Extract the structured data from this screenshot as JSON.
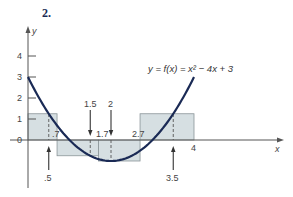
{
  "problem_label": "2.",
  "colors": {
    "curve": "#1a2a55",
    "fill": "#d6dfe2",
    "rect_stroke": "#8a9598",
    "axis": "#555555",
    "text": "#444444"
  },
  "chart_data": {
    "type": "line",
    "title": "",
    "function_label": "y = f(x) = x² − 4x + 3",
    "xlabel": "x",
    "ylabel": "y",
    "y_ticks": [
      "0",
      "1",
      "2",
      "3",
      "4"
    ],
    "x_tick_labels": [
      "4"
    ],
    "xlim": [
      0,
      6.1
    ],
    "ylim": [
      -2,
      4.8
    ],
    "curve": {
      "expression": "x^2 - 4x + 3",
      "x_range": [
        0,
        4
      ]
    },
    "rectangles": [
      {
        "x0": 0,
        "x1": 0.7,
        "height": 1.25,
        "sample_x": 0.5
      },
      {
        "x0": 0.7,
        "x1": 1.7,
        "height": -0.75,
        "sample_x": 1.5
      },
      {
        "x0": 1.7,
        "x1": 2.7,
        "height": -1.0,
        "sample_x": 2
      },
      {
        "x0": 2.7,
        "x1": 4,
        "height": 1.25,
        "sample_x": 3.5
      }
    ],
    "partition_labels": [
      ".7",
      "1.7",
      "2.7",
      "4"
    ],
    "sample_point_labels": [
      ".5",
      "1.5",
      "2",
      "3.5"
    ]
  }
}
